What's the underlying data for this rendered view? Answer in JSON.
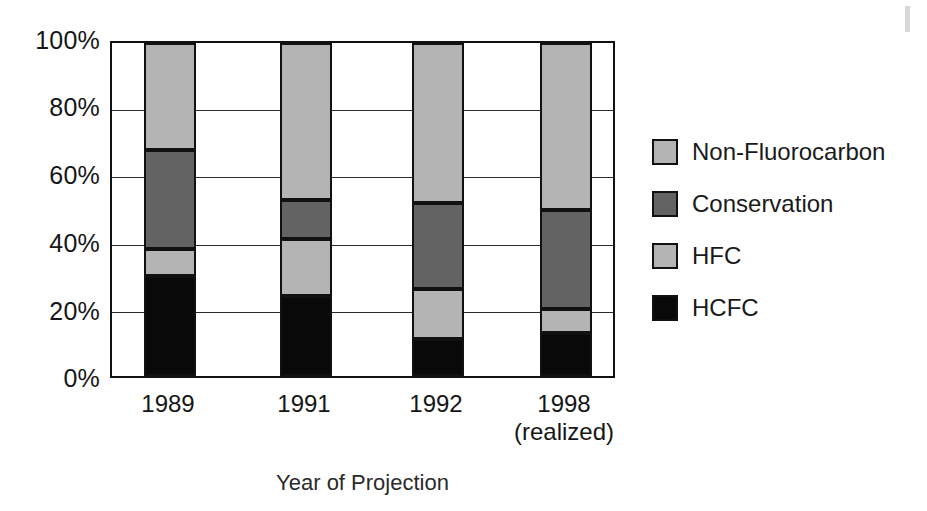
{
  "chart_data": {
    "type": "bar",
    "subtype": "stacked-bar-100-percent",
    "title": "",
    "xlabel": "Year of Projection",
    "ylabel": "",
    "ylim": [
      0,
      100
    ],
    "yunit": "%",
    "grid": true,
    "legend_position": "right",
    "categories": [
      "1989",
      "1991",
      "1992",
      "1998"
    ],
    "category_sublabels": [
      "",
      "",
      "",
      "(realized)"
    ],
    "ytick_labels": [
      "100%",
      "80%",
      "60%",
      "40%",
      "20%",
      "0%"
    ],
    "ytick_values": [
      100,
      80,
      60,
      40,
      20,
      0
    ],
    "series": [
      {
        "name": "Non-Fluorocarbon",
        "color": "#b4b4b4",
        "values": [
          32,
          47,
          48,
          50
        ]
      },
      {
        "name": "Conservation",
        "color": "#636363",
        "values": [
          30,
          12,
          26,
          30
        ]
      },
      {
        "name": "HFC",
        "color": "#b4b4b4",
        "values": [
          8,
          17,
          15,
          7
        ]
      },
      {
        "name": "HCFC",
        "color": "#090909",
        "values": [
          30,
          24,
          11,
          13
        ]
      }
    ],
    "stack_boundaries": {
      "1989": {
        "hcfc": [
          0,
          30
        ],
        "hfc": [
          30,
          38
        ],
        "conservation": [
          38,
          68
        ],
        "nonfluorocarbon": [
          68,
          100
        ]
      },
      "1991": {
        "hcfc": [
          0,
          24
        ],
        "hfc": [
          24,
          41
        ],
        "conservation": [
          41,
          53
        ],
        "nonfluorocarbon": [
          53,
          100
        ]
      },
      "1992": {
        "hcfc": [
          0,
          11
        ],
        "hfc": [
          11,
          26
        ],
        "conservation": [
          26,
          52
        ],
        "nonfluorocarbon": [
          52,
          100
        ]
      },
      "1998": {
        "hcfc": [
          0,
          13
        ],
        "hfc": [
          13,
          20
        ],
        "conservation": [
          20,
          50
        ],
        "nonfluorocarbon": [
          50,
          100
        ]
      }
    }
  },
  "legend": {
    "items": [
      {
        "label": "Non-Fluorocarbon",
        "color": "#b4b4b4"
      },
      {
        "label": "Conservation",
        "color": "#636363"
      },
      {
        "label": "HFC",
        "color": "#b4b4b4"
      },
      {
        "label": "HCFC",
        "color": "#090909"
      }
    ]
  },
  "axes": {
    "y": {
      "ticks": [
        "100%",
        "80%",
        "60%",
        "40%",
        "20%",
        "0%"
      ]
    },
    "x": {
      "ticks": [
        {
          "main": "1989",
          "sub": ""
        },
        {
          "main": "1991",
          "sub": ""
        },
        {
          "main": "1992",
          "sub": ""
        },
        {
          "main": "1998",
          "sub": "(realized)"
        }
      ],
      "title": "Year of Projection"
    }
  }
}
